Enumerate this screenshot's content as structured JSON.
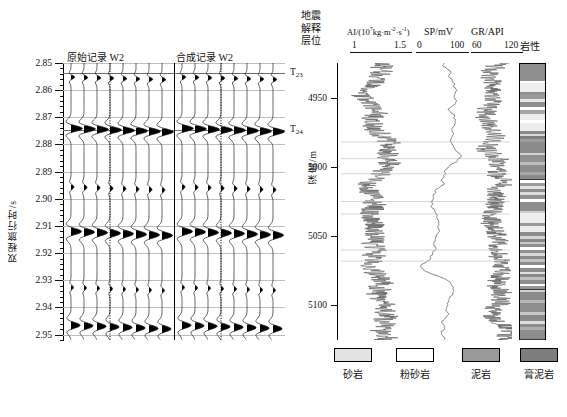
{
  "figure": {
    "type": "seismic-well-log-correlation"
  },
  "left_panel": {
    "title_original": "原始记录",
    "title_original_well": "W2",
    "title_synthetic": "合成记录",
    "title_synthetic_well": "W2",
    "y_axis_title": "双程旅行时/s",
    "y_ticks": [
      "2.85",
      "2.86",
      "2.87",
      "2.88",
      "2.89",
      "2.90",
      "2.91",
      "2.92",
      "2.93",
      "2.94",
      "2.95"
    ],
    "y_min": 2.85,
    "y_max": 2.952,
    "horizons": [
      {
        "name": "T23",
        "base": "T",
        "sub": "23",
        "time": 2.8535
      },
      {
        "name": "T24",
        "base": "T",
        "sub": "24",
        "time": 2.8745
      }
    ],
    "traces_per_group": 8,
    "highlighted_trace_index": 3,
    "highlighted_trace_label": "W2"
  },
  "right_panel": {
    "header_horizon": [
      "地震",
      "解释",
      "层位"
    ],
    "depth_axis_title": "深度/m",
    "depth_ticks": [
      "4950",
      "5000",
      "5050",
      "5100"
    ],
    "depth_min": 4925,
    "depth_max": 5125,
    "lithology_title": "岩性",
    "curves": [
      {
        "name": "AI",
        "header": "AI/(10⁷kg·m⁻²·s⁻¹)",
        "header_base": "AI/(10",
        "header_exp": "7",
        "header_mid": "kg·m",
        "header_exp2": "-2",
        "header_mid2": "·s",
        "header_exp3": "-1",
        "header_end": ")",
        "min_label": "1",
        "max_label": "1.5",
        "min": 1,
        "max": 1.5,
        "style": "spiky"
      },
      {
        "name": "SP",
        "header": "SP/mV",
        "min_label": "0",
        "max_label": "100",
        "min": 0,
        "max": 100,
        "style": "smooth"
      },
      {
        "name": "GR",
        "header": "GR/API",
        "min_label": "60",
        "max_label": "120",
        "min": 60,
        "max": 120,
        "style": "spiky"
      }
    ]
  },
  "legend": {
    "items": [
      {
        "label": "砂岩",
        "key": "sandstone",
        "color": "#e3e3e3"
      },
      {
        "label": "粉砂岩",
        "key": "siltstone",
        "color": "#ffffff"
      },
      {
        "label": "泥岩",
        "key": "mudstone",
        "color": "#9a9a9a"
      },
      {
        "label": "膏泥岩",
        "key": "gypsum-mudstone",
        "color": "#7d7d7d"
      }
    ]
  },
  "lithology_beds": [
    {
      "top": 0.0,
      "height": 0.062,
      "fill": "#8f8f8f"
    },
    {
      "top": 0.062,
      "height": 0.008,
      "fill": "#ffffff"
    },
    {
      "top": 0.07,
      "height": 0.03,
      "fill": "#efefef"
    },
    {
      "top": 0.1,
      "height": 0.01,
      "fill": "#8f8f8f"
    },
    {
      "top": 0.11,
      "height": 0.018,
      "fill": "#9a9a9a"
    },
    {
      "top": 0.128,
      "height": 0.009,
      "fill": "#e8e8e8"
    },
    {
      "top": 0.137,
      "height": 0.02,
      "fill": "#8f8f8f"
    },
    {
      "top": 0.157,
      "height": 0.012,
      "fill": "#ffffff"
    },
    {
      "top": 0.169,
      "height": 0.013,
      "fill": "#a5a5a5"
    },
    {
      "top": 0.182,
      "height": 0.021,
      "fill": "#ececec"
    },
    {
      "top": 0.203,
      "height": 0.012,
      "fill": "#ffffff"
    },
    {
      "top": 0.215,
      "height": 0.028,
      "fill": "#ededed"
    },
    {
      "top": 0.243,
      "height": 0.012,
      "fill": "#8a8a8a"
    },
    {
      "top": 0.255,
      "height": 0.008,
      "fill": "#d9d9d9"
    },
    {
      "top": 0.263,
      "height": 0.01,
      "fill": "#7f7f7f"
    },
    {
      "top": 0.273,
      "height": 0.009,
      "fill": "#9d9d9d"
    },
    {
      "top": 0.282,
      "height": 0.04,
      "fill": "#8c8c8c"
    },
    {
      "top": 0.322,
      "height": 0.01,
      "fill": "#d2d2d2"
    },
    {
      "top": 0.332,
      "height": 0.026,
      "fill": "#909090"
    },
    {
      "top": 0.358,
      "height": 0.01,
      "fill": "#bdbdbd"
    },
    {
      "top": 0.368,
      "height": 0.024,
      "fill": "#8d8d8d"
    },
    {
      "top": 0.392,
      "height": 0.01,
      "fill": "#a8a8a8"
    },
    {
      "top": 0.402,
      "height": 0.018,
      "fill": "#8a8a8a"
    },
    {
      "top": 0.42,
      "height": 0.012,
      "fill": "#ffffff"
    },
    {
      "top": 0.432,
      "height": 0.013,
      "fill": "#9b9b9b"
    },
    {
      "top": 0.445,
      "height": 0.01,
      "fill": "#e2e2e2"
    },
    {
      "top": 0.455,
      "height": 0.012,
      "fill": "#8d8d8d"
    },
    {
      "top": 0.467,
      "height": 0.011,
      "fill": "#dddddd"
    },
    {
      "top": 0.478,
      "height": 0.012,
      "fill": "#919191"
    },
    {
      "top": 0.49,
      "height": 0.013,
      "fill": "#ffffff"
    },
    {
      "top": 0.503,
      "height": 0.03,
      "fill": "#8e8e8e"
    },
    {
      "top": 0.533,
      "height": 0.01,
      "fill": "#cfcfcf"
    },
    {
      "top": 0.543,
      "height": 0.035,
      "fill": "#ededed"
    },
    {
      "top": 0.578,
      "height": 0.012,
      "fill": "#999999"
    },
    {
      "top": 0.59,
      "height": 0.02,
      "fill": "#ececec"
    },
    {
      "top": 0.61,
      "height": 0.016,
      "fill": "#8c8c8c"
    },
    {
      "top": 0.626,
      "height": 0.01,
      "fill": "#d6d6d6"
    },
    {
      "top": 0.636,
      "height": 0.01,
      "fill": "#8a8a8a"
    },
    {
      "top": 0.646,
      "height": 0.009,
      "fill": "#cacaca"
    },
    {
      "top": 0.655,
      "height": 0.012,
      "fill": "#909090"
    },
    {
      "top": 0.667,
      "height": 0.008,
      "fill": "#ffffff"
    },
    {
      "top": 0.675,
      "height": 0.014,
      "fill": "#8f8f8f"
    },
    {
      "top": 0.689,
      "height": 0.01,
      "fill": "#dadada"
    },
    {
      "top": 0.699,
      "height": 0.01,
      "fill": "#8b8b8b"
    },
    {
      "top": 0.709,
      "height": 0.012,
      "fill": "#c4c4c4"
    },
    {
      "top": 0.721,
      "height": 0.01,
      "fill": "#8e8e8e"
    },
    {
      "top": 0.731,
      "height": 0.011,
      "fill": "#ffffff"
    },
    {
      "top": 0.742,
      "height": 0.013,
      "fill": "#8c8c8c"
    },
    {
      "top": 0.755,
      "height": 0.009,
      "fill": "#e0e0e0"
    },
    {
      "top": 0.764,
      "height": 0.012,
      "fill": "#8a8a8a"
    },
    {
      "top": 0.776,
      "height": 0.009,
      "fill": "#bfbfbf"
    },
    {
      "top": 0.785,
      "height": 0.014,
      "fill": "#8d8d8d"
    },
    {
      "top": 0.799,
      "height": 0.01,
      "fill": "#ffffff"
    },
    {
      "top": 0.809,
      "height": 0.011,
      "fill": "#949494"
    },
    {
      "top": 0.82,
      "height": 0.009,
      "fill": "#d4d4d4"
    },
    {
      "top": 0.829,
      "height": 0.03,
      "fill": "#8b8b8b"
    },
    {
      "top": 0.859,
      "height": 0.01,
      "fill": "#b8b8b8"
    },
    {
      "top": 0.869,
      "height": 0.033,
      "fill": "#8e8e8e"
    },
    {
      "top": 0.902,
      "height": 0.01,
      "fill": "#c8c8c8"
    },
    {
      "top": 0.912,
      "height": 0.022,
      "fill": "#8a8a8a"
    },
    {
      "top": 0.934,
      "height": 0.011,
      "fill": "#dcdcdc"
    },
    {
      "top": 0.945,
      "height": 0.012,
      "fill": "#8d8d8d"
    },
    {
      "top": 0.957,
      "height": 0.01,
      "fill": "#aeaeae"
    },
    {
      "top": 0.967,
      "height": 0.033,
      "fill": "#8c8c8c"
    }
  ],
  "chart_data": {
    "type": "line",
    "title": "",
    "panels": [
      {
        "id": "seismic",
        "type": "wiggle-variable-area",
        "xlabel": "",
        "ylabel": "双程旅行时/s",
        "ylim": [
          2.85,
          2.952
        ],
        "yticks": [
          2.85,
          2.86,
          2.87,
          2.88,
          2.89,
          2.9,
          2.91,
          2.92,
          2.93,
          2.94,
          2.95
        ],
        "groups": [
          {
            "name": "原始记录 W2",
            "n_traces": 8
          },
          {
            "name": "合成记录 W2",
            "n_traces": 8
          }
        ],
        "annotations": [
          {
            "text": "T23",
            "y": 2.8535
          },
          {
            "text": "T24",
            "y": 2.8745
          }
        ],
        "wavelet_events": [
          {
            "time": 2.8745,
            "amplitude": 1.0
          },
          {
            "time": 2.9125,
            "amplitude": 0.85
          },
          {
            "time": 2.9465,
            "amplitude": 0.7
          },
          {
            "time": 2.8565,
            "amplitude": 0.3
          }
        ]
      },
      {
        "id": "well-logs",
        "type": "line",
        "ylabel": "深度/m",
        "ylim": [
          5125,
          4925
        ],
        "yticks": [
          4950,
          5000,
          5050,
          5100
        ],
        "series": [
          {
            "name": "AI",
            "unit": "10^7 kg·m^-2·s^-1",
            "xlim": [
              1,
              1.5
            ],
            "grid": false
          },
          {
            "name": "SP",
            "unit": "mV",
            "xlim": [
              0,
              100
            ],
            "grid": false
          },
          {
            "name": "GR",
            "unit": "API",
            "xlim": [
              60,
              120
            ],
            "grid": false
          }
        ]
      }
    ],
    "legend_position": "bottom",
    "legend_entries": [
      "砂岩",
      "粉砂岩",
      "泥岩",
      "膏泥岩"
    ]
  }
}
